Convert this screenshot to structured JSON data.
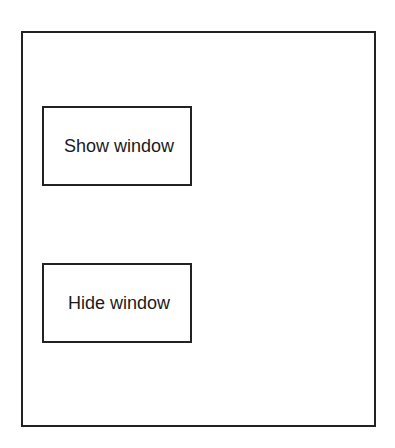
{
  "window": {
    "buttons": [
      {
        "id": "show",
        "label": "Show window"
      },
      {
        "id": "hide",
        "label": "Hide window"
      }
    ]
  },
  "colors": {
    "border": "#222222",
    "background": "#ffffff",
    "text": "#1a1a1a"
  }
}
